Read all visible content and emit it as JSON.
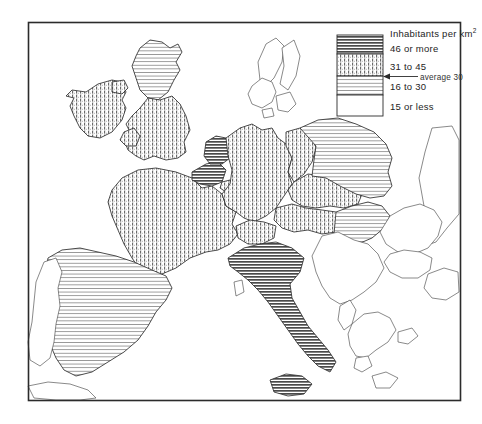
{
  "figure": {
    "name": "population-density-map-europe",
    "frame": {
      "visible": true,
      "color": "#2b2b2b"
    },
    "background_color": "#ffffff"
  },
  "legend": {
    "title": "Inhabitants per km",
    "title_superscript": "2",
    "average_note": "average 30",
    "classes": [
      {
        "label": "46 or more",
        "pattern": "dense-horizontal-lines",
        "swatch_fill": "#8f8f8f"
      },
      {
        "label": "31 to 45",
        "pattern": "vertical-stipple-lines",
        "swatch_fill": "#b5b5b5"
      },
      {
        "label": "16 to 30",
        "pattern": "sparse-horizontal-lines",
        "swatch_fill": "#d8d8d8"
      },
      {
        "label": "15 or less",
        "pattern": "blank-white",
        "swatch_fill": "#ffffff"
      }
    ]
  },
  "map_data": {
    "type": "choropleth",
    "region": "Western and Central Europe",
    "unit": "inhabitants per square kilometre",
    "average_value": 30,
    "class_breaks": [
      15,
      30,
      45,
      46
    ],
    "areas": [
      {
        "name": "Ireland",
        "class": "31 to 45",
        "pattern": "vertical-stipple-lines"
      },
      {
        "name": "Scotland",
        "class": "16 to 30",
        "pattern": "sparse-horizontal-lines"
      },
      {
        "name": "England and Wales",
        "class": "31 to 45",
        "pattern": "vertical-stipple-lines"
      },
      {
        "name": "Northern Ireland",
        "class": "31 to 45",
        "pattern": "vertical-stipple-lines"
      },
      {
        "name": "France",
        "class": "31 to 45",
        "pattern": "vertical-stipple-lines"
      },
      {
        "name": "Belgium",
        "class": "46 or more",
        "pattern": "dense-horizontal-lines"
      },
      {
        "name": "Netherlands",
        "class": "46 or more",
        "pattern": "dense-horizontal-lines"
      },
      {
        "name": "Luxembourg",
        "class": "31 to 45",
        "pattern": "vertical-stipple-lines"
      },
      {
        "name": "West Germany",
        "class": "31 to 45",
        "pattern": "vertical-stipple-lines"
      },
      {
        "name": "East Germany",
        "class": "31 to 45",
        "pattern": "vertical-stipple-lines"
      },
      {
        "name": "Switzerland",
        "class": "31 to 45",
        "pattern": "vertical-stipple-lines"
      },
      {
        "name": "Austria",
        "class": "31 to 45",
        "pattern": "vertical-stipple-lines"
      },
      {
        "name": "Czechoslovakia",
        "class": "31 to 45",
        "pattern": "vertical-stipple-lines"
      },
      {
        "name": "Italy",
        "class": "46 or more",
        "pattern": "dense-horizontal-lines"
      },
      {
        "name": "Spain",
        "class": "16 to 30",
        "pattern": "sparse-horizontal-lines"
      },
      {
        "name": "Portugal",
        "class": "15 or less",
        "pattern": "blank-white"
      },
      {
        "name": "Poland",
        "class": "16 to 30",
        "pattern": "sparse-horizontal-lines"
      },
      {
        "name": "Hungary",
        "class": "16 to 30",
        "pattern": "sparse-horizontal-lines"
      },
      {
        "name": "Denmark",
        "class": "15 or less",
        "pattern": "blank-white"
      },
      {
        "name": "Romania",
        "class": "15 or less",
        "pattern": "blank-white"
      },
      {
        "name": "Yugoslavia",
        "class": "15 or less",
        "pattern": "blank-white"
      },
      {
        "name": "Bulgaria",
        "class": "15 or less",
        "pattern": "blank-white"
      },
      {
        "name": "Greece",
        "class": "15 or less",
        "pattern": "blank-white"
      },
      {
        "name": "Albania",
        "class": "15 or less",
        "pattern": "blank-white"
      },
      {
        "name": "Norway",
        "class": "15 or less",
        "pattern": "blank-white"
      },
      {
        "name": "Sweden",
        "class": "15 or less",
        "pattern": "blank-white"
      },
      {
        "name": "Turkey",
        "class": "15 or less",
        "pattern": "blank-white"
      },
      {
        "name": "Soviet Union",
        "class": "15 or less",
        "pattern": "blank-white"
      }
    ]
  }
}
